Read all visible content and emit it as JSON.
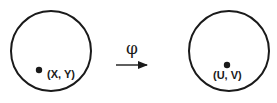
{
  "diagram": {
    "source": {
      "shape": "circle",
      "point_label": "(X, Y)"
    },
    "mapping": {
      "symbol": "φ",
      "direction": "right"
    },
    "target": {
      "shape": "circle",
      "point_label": "(U, V)"
    },
    "colors": {
      "stroke": "#1a1a1a",
      "background": "#ffffff"
    }
  }
}
